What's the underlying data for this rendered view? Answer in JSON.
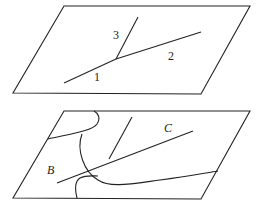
{
  "top_panel": {
    "labels": {
      "segment_1": "1",
      "segment_2": "2",
      "segment_3": "3"
    }
  },
  "bottom_panel": {
    "labels": {
      "region_b": "B",
      "region_c": "C"
    }
  },
  "colors": {
    "stroke": "#222222",
    "background": "#ffffff"
  }
}
